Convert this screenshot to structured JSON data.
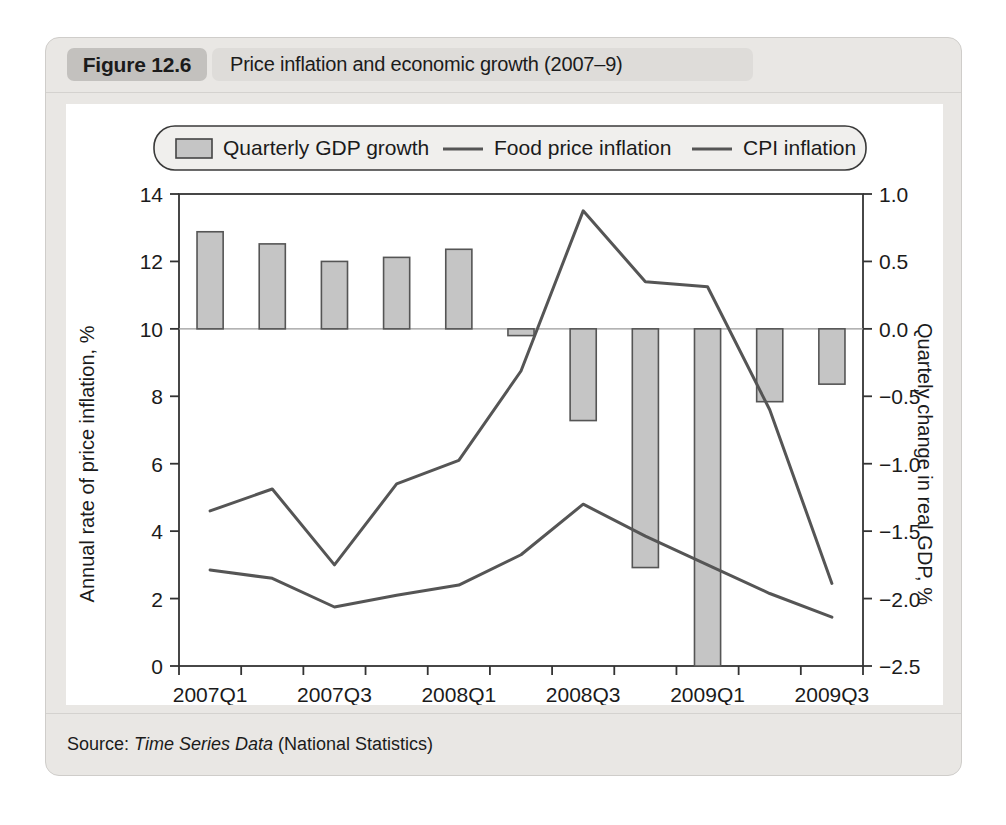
{
  "figure": {
    "badge": "Figure 12.6",
    "title": "Price inflation and economic growth (2007–9)",
    "source_prefix": "Source: ",
    "source_italic": "Time Series Data",
    "source_suffix": " (National Statistics)"
  },
  "legend": {
    "items": [
      {
        "label": "Quarterly GDP growth",
        "marker": "swatch",
        "color": "#c5c5c5"
      },
      {
        "label": "Food price inflation",
        "marker": "line",
        "color": "#555555"
      },
      {
        "label": "CPI inflation",
        "marker": "line",
        "color": "#555555"
      }
    ]
  },
  "colors": {
    "bar_fill": "#c5c5c5",
    "bar_stroke": "#555555",
    "line": "#555555",
    "axis": "#333333",
    "plot_bg": "#ffffff",
    "card_bg": "#e9e7e4",
    "badge_bg": "#c3c1be",
    "title_pill_bg": "#dedcd9"
  },
  "chart_data": {
    "type": "bar",
    "title": "Price inflation and economic growth (2007–9)",
    "xlabel": "",
    "ylabel": "Annual rate of price inflation, %",
    "y2label": "Quartely change in real GDP, %",
    "grid": false,
    "legend_position": "top",
    "x": [
      "2007Q1",
      "2007Q2",
      "2007Q3",
      "2007Q4",
      "2008Q1",
      "2008Q2",
      "2008Q3",
      "2008Q4",
      "2009Q1",
      "2009Q2",
      "2009Q3"
    ],
    "xtick_labels": [
      "2007Q1",
      "",
      "2007Q3",
      "",
      "2008Q1",
      "",
      "2008Q3",
      "",
      "2009Q1",
      "",
      "2009Q3"
    ],
    "ylim": [
      0,
      14
    ],
    "yticks": [
      0,
      2,
      4,
      6,
      8,
      10,
      12,
      14
    ],
    "ytick_labels": [
      "0",
      "2",
      "4",
      "6",
      "8",
      "10",
      "12",
      "14"
    ],
    "y2lim": [
      -2.5,
      1.0
    ],
    "y2ticks": [
      -2.5,
      -2.0,
      -1.5,
      -1.0,
      -0.5,
      0.0,
      0.5,
      1.0
    ],
    "y2tick_labels": [
      "−2.5",
      "−2.0",
      "−1.5",
      "−1.0",
      "−0.5",
      "0.0",
      "0.5",
      "1.0"
    ],
    "series": [
      {
        "name": "Quarterly GDP growth",
        "type": "bar",
        "axis": "right",
        "unit": "%",
        "values": [
          0.72,
          0.63,
          0.5,
          0.53,
          0.59,
          -0.05,
          -0.68,
          -1.77,
          -2.5,
          -0.54,
          -0.41
        ]
      },
      {
        "name": "Food price inflation",
        "type": "line",
        "axis": "left",
        "unit": "%",
        "values": [
          4.6,
          5.25,
          3.0,
          5.4,
          6.1,
          8.75,
          13.5,
          11.4,
          11.25,
          7.6,
          2.45
        ]
      },
      {
        "name": "CPI inflation",
        "type": "line",
        "axis": "left",
        "unit": "%",
        "values": [
          2.85,
          2.6,
          1.75,
          2.1,
          2.4,
          3.3,
          4.8,
          3.85,
          3.0,
          2.15,
          1.45
        ]
      }
    ]
  }
}
